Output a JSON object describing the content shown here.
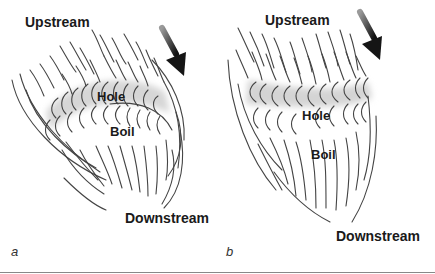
{
  "figure": {
    "panels": [
      {
        "id": "a",
        "letter": "a",
        "labels": {
          "upstream": "Upstream",
          "hole": "Hole",
          "boil": "Boil",
          "downstream": "Downstream"
        }
      },
      {
        "id": "b",
        "letter": "b",
        "labels": {
          "upstream": "Upstream",
          "hole": "Hole",
          "boil": "Boil",
          "downstream": "Downstream"
        }
      }
    ],
    "colors": {
      "line": "#444444",
      "band": "#d4d4d4",
      "arrow": "#222222",
      "text": "#1a1a1a"
    }
  }
}
